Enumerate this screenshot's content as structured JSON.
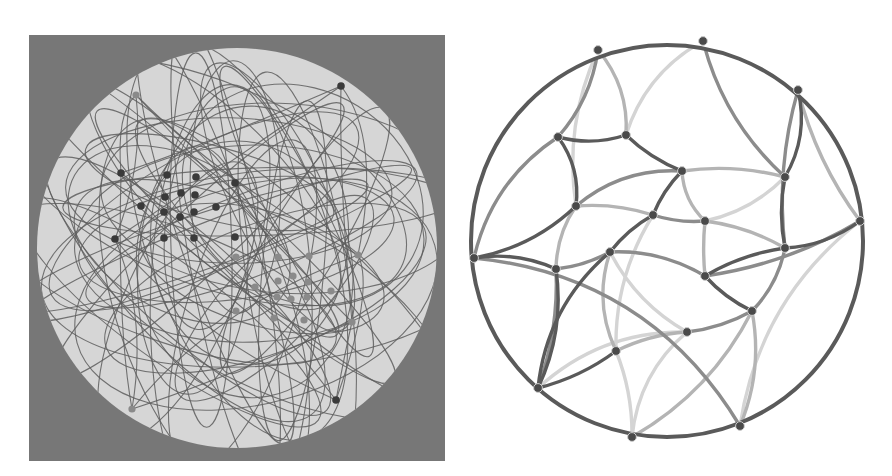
{
  "figure": {
    "left_panel": {
      "description": "Poincare disk with hyperbolic geodesics (arcs) through two clusters of points",
      "background_color": "#777777",
      "disk_color": "#d6d6d6",
      "arc_color": "#5e5e5e",
      "dark_node_color": "#3a3a3a",
      "light_node_color": "#8a8a8a",
      "dark_nodes": [
        [
          341,
          86
        ],
        [
          121,
          173
        ],
        [
          167,
          175
        ],
        [
          196,
          177
        ],
        [
          235,
          183
        ],
        [
          165,
          197
        ],
        [
          181,
          193
        ],
        [
          195,
          195
        ],
        [
          141,
          206
        ],
        [
          216,
          207
        ],
        [
          164,
          212
        ],
        [
          180,
          217
        ],
        [
          194,
          212
        ],
        [
          115,
          239
        ],
        [
          164,
          238
        ],
        [
          194,
          238
        ],
        [
          235,
          237
        ],
        [
          336,
          400
        ]
      ],
      "light_nodes": [
        [
          136,
          95
        ],
        [
          236,
          257
        ],
        [
          278,
          257
        ],
        [
          309,
          256
        ],
        [
          358,
          255
        ],
        [
          293,
          276
        ],
        [
          278,
          281
        ],
        [
          308,
          282
        ],
        [
          255,
          287
        ],
        [
          331,
          291
        ],
        [
          277,
          297
        ],
        [
          291,
          299
        ],
        [
          307,
          297
        ],
        [
          236,
          311
        ],
        [
          274,
          318
        ],
        [
          304,
          320
        ],
        [
          352,
          322
        ],
        [
          132,
          409
        ]
      ]
    },
    "right_panel": {
      "description": "Hyperbolic tiling of a disk with curved edges in graded gray tones",
      "boundary_color": "#5a5a5a",
      "node_color": "#4a4a4a",
      "edge_colors": [
        "#5a5a5a",
        "#8c8c8c",
        "#b4b4b4",
        "#d4d4d4"
      ],
      "nodes": [
        [
          598,
          50
        ],
        [
          703,
          41
        ],
        [
          798,
          90
        ],
        [
          558,
          137
        ],
        [
          626,
          135
        ],
        [
          682,
          171
        ],
        [
          785,
          177
        ],
        [
          576,
          206
        ],
        [
          653,
          215
        ],
        [
          705,
          221
        ],
        [
          474,
          258
        ],
        [
          556,
          269
        ],
        [
          610,
          252
        ],
        [
          785,
          248
        ],
        [
          860,
          221
        ],
        [
          705,
          276
        ],
        [
          752,
          311
        ],
        [
          687,
          332
        ],
        [
          616,
          351
        ],
        [
          538,
          388
        ],
        [
          632,
          437
        ],
        [
          740,
          426
        ]
      ]
    }
  }
}
